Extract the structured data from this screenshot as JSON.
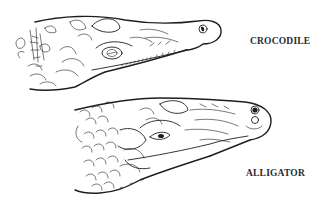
{
  "figure": {
    "labels": {
      "crocodile": "CROCODILE",
      "alligator": "ALLIGATOR"
    },
    "colors": {
      "background": "#ffffff",
      "ink": "#1e1e1e",
      "label_text": "#2a2a2a"
    }
  }
}
